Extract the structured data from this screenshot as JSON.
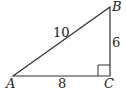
{
  "diagram": {
    "type": "right-triangle",
    "vertices": {
      "A": {
        "label": "A",
        "x": 13,
        "y": 76
      },
      "B": {
        "label": "B",
        "x": 110,
        "y": 7
      },
      "C": {
        "label": "C",
        "x": 110,
        "y": 76
      }
    },
    "sides": {
      "AB": {
        "label": "10"
      },
      "BC": {
        "label": "6"
      },
      "AC": {
        "label": "8"
      }
    },
    "right_angle_at": "C",
    "stroke_color": "#333333"
  }
}
